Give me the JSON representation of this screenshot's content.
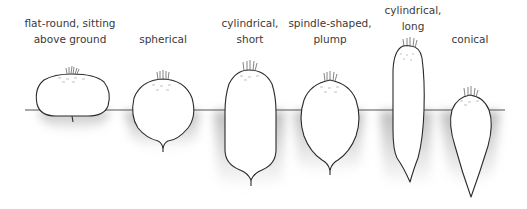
{
  "diagram": {
    "type": "root-shape-comparison",
    "ground_line": {
      "y": 110,
      "x_start": 25,
      "x_end": 505,
      "color": "#555555"
    },
    "colors": {
      "outline": "#2b2b2b",
      "soil_shade": "#b8b8b8",
      "fill": "#ffffff",
      "text": "#3a3a3a"
    },
    "shapes": [
      {
        "id": "flat-round",
        "lines": [
          "flat-round, sitting",
          "above ground"
        ],
        "label_x": 70,
        "label_top": 15
      },
      {
        "id": "spherical",
        "lines": [
          "",
          "spherical"
        ],
        "label_x": 163,
        "label_top": 15
      },
      {
        "id": "cylindrical-short",
        "lines": [
          "cylindrical,",
          "short"
        ],
        "label_x": 250,
        "label_top": 15
      },
      {
        "id": "spindle-shaped-plump",
        "lines": [
          "spindle-shaped,",
          "plump"
        ],
        "label_x": 330,
        "label_top": 15
      },
      {
        "id": "cylindrical-long",
        "lines": [
          "cylindrical,",
          "long"
        ],
        "label_x": 413,
        "label_top": 2
      },
      {
        "id": "conical",
        "lines": [
          "",
          "conical"
        ],
        "label_x": 470,
        "label_top": 15
      }
    ]
  }
}
